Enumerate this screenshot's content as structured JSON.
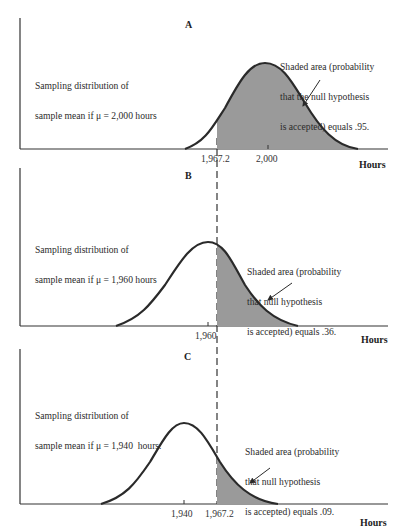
{
  "panels": [
    {
      "label": "A",
      "mu": 2000,
      "left_text": [
        "Sampling distribution of",
        "sample mean if μ = 2,000 hours"
      ],
      "right_text": [
        "Shaded area (probability",
        "that the null hypothesis",
        "is accepted) equals .95."
      ],
      "ticks": [
        "1,967.2",
        "2,000"
      ],
      "axis_title": "Hours",
      "shaded_probability": 0.95
    },
    {
      "label": "B",
      "mu": 1960,
      "left_text": [
        "Sampling distribution of",
        "sample mean if μ = 1,960 hours"
      ],
      "right_text": [
        "Shaded area (probability",
        "that null hypothesis",
        "is accepted) equals .36."
      ],
      "ticks": [
        "1,960"
      ],
      "axis_title": "Hours",
      "shaded_probability": 0.36
    },
    {
      "label": "C",
      "mu": 1940,
      "left_text": [
        "Sampling distribution of",
        "sample mean if μ = 1,940  hours."
      ],
      "right_text": [
        "Shaded area (probability",
        "that null hypothesis",
        "is accepted) equals .09."
      ],
      "ticks": [
        "1,940",
        "1,967.2"
      ],
      "axis_title": "Hours",
      "shaded_probability": 0.09
    }
  ],
  "critical_value": "1,967.2",
  "colors": {
    "curve": "#2a2a2a",
    "shade": "#9a9a9a",
    "axis": "#333333",
    "dashed": "#333333"
  }
}
